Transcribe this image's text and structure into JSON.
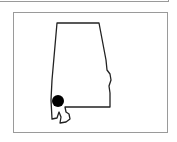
{
  "map": {
    "region": "Alabama",
    "marker": {
      "label": "location-marker",
      "color": "#000000"
    },
    "outline_color": "#222222",
    "frame_color": "#9a9a9a"
  }
}
